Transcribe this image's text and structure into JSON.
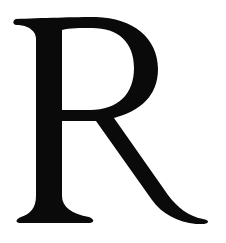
{
  "glyph": {
    "character": "R",
    "style": "serif capital letter",
    "color": "#0a0a0a",
    "background": "#ffffff"
  }
}
